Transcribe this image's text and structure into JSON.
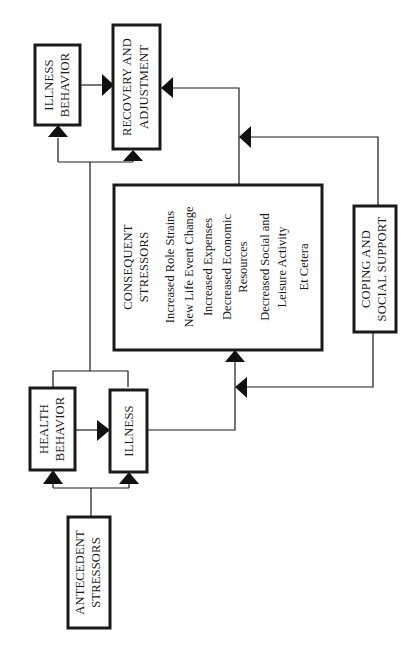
{
  "diagram": {
    "orientation": "rotated 90deg counter-clockwise (reads bottom-to-top)",
    "nodes": {
      "antecedent": {
        "line1": "ANTECEDENT",
        "line2": "STRESSORS"
      },
      "health_behavior": {
        "line1": "HEALTH",
        "line2": "BEHAVIOR"
      },
      "illness": {
        "line1": "ILLNESS"
      },
      "consequent": {
        "line1": "CONSEQUENT",
        "line2": "STRESSORS",
        "items": [
          "Increased Role Strains",
          "New Life Event Change",
          "Increased Expenses",
          "Decreased Economic",
          "Resources",
          "Decreased Social and",
          "Leisure Activity",
          "Et Cetera"
        ]
      },
      "coping": {
        "line1": "COPING AND",
        "line2": "SOCIAL SUPPORT"
      },
      "illness_behavior": {
        "line1": "ILLNESS",
        "line2": "BEHAVIOR"
      },
      "recovery": {
        "line1": "RECOVERY AND",
        "line2": "ADJUSTMENT"
      }
    },
    "edges": [
      {
        "from": "ANTECEDENT STRESSORS",
        "to": "HEALTH BEHAVIOR"
      },
      {
        "from": "ANTECEDENT STRESSORS",
        "to": "ILLNESS"
      },
      {
        "from": "HEALTH BEHAVIOR",
        "to": "ILLNESS"
      },
      {
        "from": "ILLNESS",
        "to": "CONSEQUENT STRESSORS"
      },
      {
        "from": "COPING AND SOCIAL SUPPORT",
        "to": "ILLNESS-CONSEQUENT link"
      },
      {
        "from": "HEALTH BEHAVIOR / ILLNESS",
        "to": "ILLNESS BEHAVIOR"
      },
      {
        "from": "HEALTH BEHAVIOR / ILLNESS",
        "to": "RECOVERY AND ADJUSTMENT"
      },
      {
        "from": "ILLNESS BEHAVIOR",
        "to": "RECOVERY AND ADJUSTMENT"
      },
      {
        "from": "CONSEQUENT STRESSORS",
        "to": "RECOVERY AND ADJUSTMENT"
      },
      {
        "from": "COPING AND SOCIAL SUPPORT",
        "to": "CONSEQUENT-RECOVERY link"
      }
    ],
    "colors": {
      "ink": "#1a1a1a",
      "background": "#ffffff"
    }
  }
}
